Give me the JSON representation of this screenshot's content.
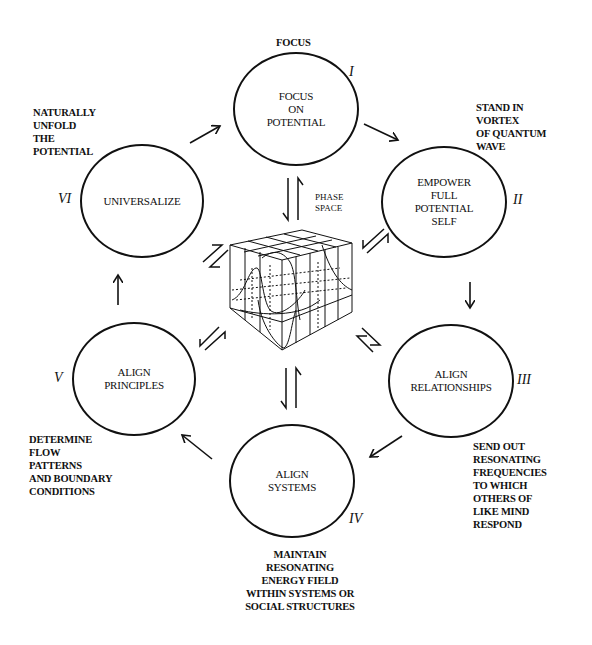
{
  "diagram": {
    "top_label": "FOCUS",
    "center": {
      "label": "PHASE\nSPACE",
      "icon": "phase-space-cube"
    },
    "nodes": [
      {
        "id": "I",
        "numeral": "I",
        "label": "FOCUS\nON\nPOTENTIAL"
      },
      {
        "id": "II",
        "numeral": "II",
        "label": "EMPOWER\nFULL\nPOTENTIAL\nSELF"
      },
      {
        "id": "III",
        "numeral": "III",
        "label": "ALIGN\nRELATIONSHIPS"
      },
      {
        "id": "IV",
        "numeral": "IV",
        "label": "ALIGN\nSYSTEMS"
      },
      {
        "id": "V",
        "numeral": "V",
        "label": "ALIGN\nPRINCIPLES"
      },
      {
        "id": "VI",
        "numeral": "VI",
        "label": "UNIVERSALIZE"
      }
    ],
    "notes": {
      "VI": "NATURALLY\nUNFOLD\nTHE\nPOTENTIAL",
      "II": "STAND IN\nVORTEX\nOF QUANTUM\nWAVE",
      "V": "DETERMINE\nFLOW\nPATTERNS\nAND BOUNDARY\nCONDITIONS",
      "III": "SEND OUT\nRESONATING\nFREQUENCIES\nTO WHICH\nOTHERS OF\nLIKE MIND\nRESPOND",
      "IV": "MAINTAIN\nRESONATING\nENERGY FIELD\nWITHIN SYSTEMS OR\nSOCIAL STRUCTURES"
    },
    "colors": {
      "ink": "#111111",
      "background": "#ffffff"
    }
  }
}
